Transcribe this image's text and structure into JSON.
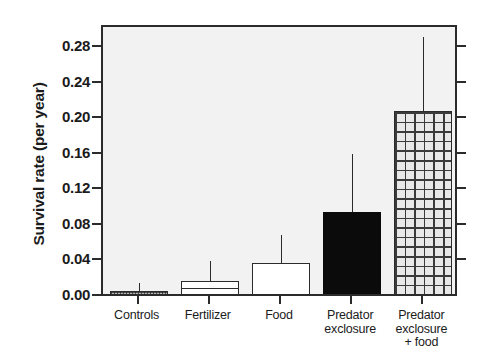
{
  "chart_data": {
    "type": "bar",
    "title": "",
    "xlabel": "",
    "ylabel": "Survival rate (per year)",
    "ylim": [
      0.0,
      0.305
    ],
    "ytick_labels": [
      "0.00",
      "0.04",
      "0.08",
      "0.12",
      "0.16",
      "0.20",
      "0.24",
      "0.28"
    ],
    "ytick_values": [
      0.0,
      0.04,
      0.08,
      0.12,
      0.16,
      0.2,
      0.24,
      0.28
    ],
    "grid": false,
    "legend": "none",
    "categories": [
      "Controls",
      "Fertilizer",
      "Food",
      "Predator exclosure",
      "Predator exclosure + food"
    ],
    "category_label_lines": [
      [
        "Controls"
      ],
      [
        "Fertilizer"
      ],
      [
        "Food"
      ],
      [
        "Predator",
        "exclosure"
      ],
      [
        "Predator",
        "exclosure",
        "+ food"
      ]
    ],
    "values": [
      0.007,
      0.018,
      0.038,
      0.096,
      0.209
    ],
    "error_upper": [
      0.016,
      0.04,
      0.07,
      0.161,
      0.292
    ],
    "fill_patterns": [
      "stipple",
      "hlines",
      "plain",
      "solid",
      "grid"
    ],
    "colors": {
      "axis": "#2b2b2b",
      "plot_background": "#f2f2f2",
      "figure_background": "#ffffff",
      "bar_solid": "#0b0b0b",
      "bar_plain": "#ffffff",
      "bar_stipple": "#b9b9b9",
      "bar_grid": "#e8e8e8",
      "text": "#1b1b1b"
    }
  }
}
